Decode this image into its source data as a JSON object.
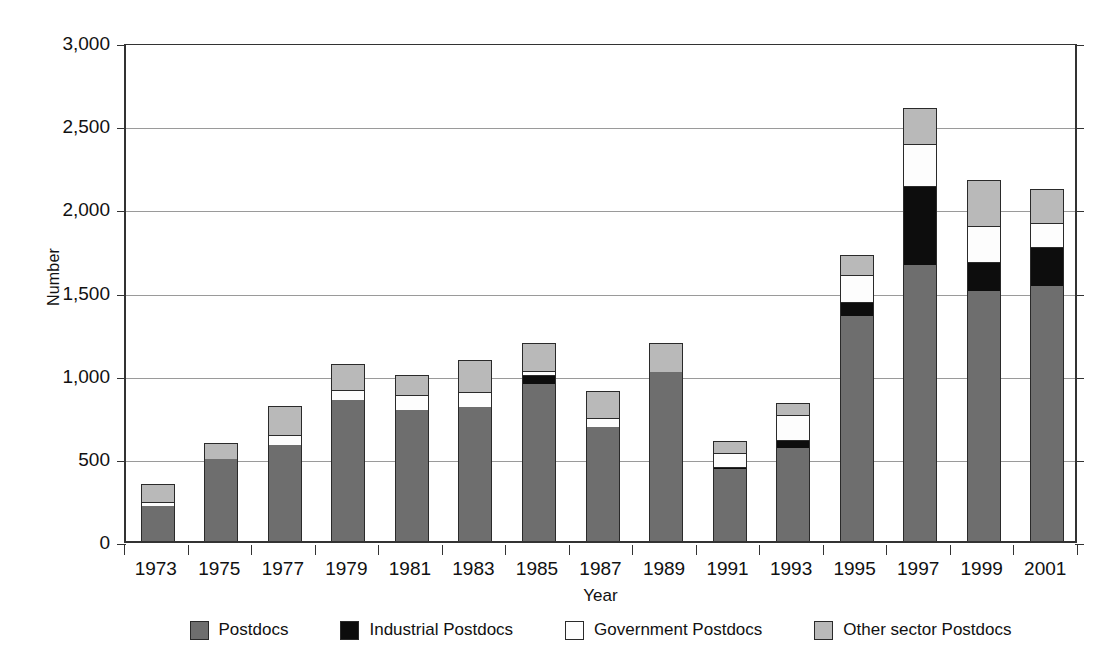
{
  "chart_data": {
    "type": "bar",
    "subtype": "stacked-bar",
    "title": "",
    "xlabel": "Year",
    "ylabel": "Number",
    "ylim": [
      0,
      3000
    ],
    "ytick_step": 500,
    "ytick_labels": [
      "3,000",
      "2,500",
      "2,000",
      "1,500",
      "1,000",
      "500",
      "0"
    ],
    "ytick_values": [
      3000,
      2500,
      2000,
      1500,
      1000,
      500,
      0
    ],
    "grid": true,
    "grid_axis": "y",
    "legend_position": "bottom",
    "categories": [
      "1973",
      "1975",
      "1977",
      "1979",
      "1981",
      "1983",
      "1985",
      "1987",
      "1989",
      "1991",
      "1993",
      "1995",
      "1997",
      "1999",
      "2001"
    ],
    "series": [
      {
        "name": "Postdocs",
        "color": "#6e6e6e",
        "values": [
          210,
          495,
          580,
          845,
          790,
          805,
          945,
          685,
          1015,
          430,
          560,
          1350,
          1660,
          1505,
          1535
        ]
      },
      {
        "name": "Industrial Postdocs",
        "color": "#0d0d0d",
        "values": [
          0,
          0,
          0,
          0,
          0,
          0,
          55,
          0,
          0,
          15,
          45,
          85,
          475,
          170,
          230
        ]
      },
      {
        "name": "Government Postdocs",
        "color": "#fdfdfd",
        "values": [
          25,
          0,
          55,
          60,
          85,
          90,
          20,
          55,
          0,
          85,
          150,
          165,
          250,
          220,
          150
        ]
      },
      {
        "name": "Other sector Postdocs",
        "color": "#b9b9b9",
        "values": [
          110,
          95,
          175,
          160,
          125,
          195,
          170,
          160,
          175,
          70,
          75,
          120,
          220,
          275,
          200
        ]
      }
    ],
    "totals": [
      345,
      590,
      810,
      1065,
      1000,
      1090,
      1190,
      900,
      1190,
      600,
      830,
      1720,
      2605,
      2170,
      2115
    ]
  },
  "legend": {
    "items": [
      {
        "label": "Postdocs",
        "swatch": "swatch-dark-gray"
      },
      {
        "label": "Industrial Postdocs",
        "swatch": "swatch-black"
      },
      {
        "label": "Government Postdocs",
        "swatch": "swatch-white"
      },
      {
        "label": "Other sector Postdocs",
        "swatch": "swatch-light-gray"
      }
    ]
  },
  "colors": {
    "postdocs": "#6e6e6e",
    "industrial": "#0d0d0d",
    "government": "#fdfdfd",
    "other": "#b9b9b9",
    "axis": "#333333",
    "grid": "#9a9a9a",
    "background": "#ffffff"
  }
}
